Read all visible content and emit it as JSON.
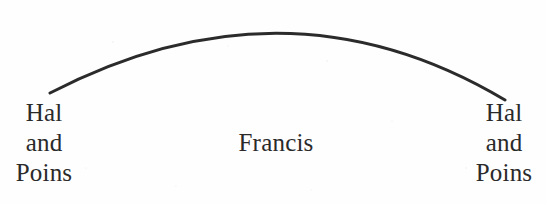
{
  "diagram": {
    "type": "arc-linked scene structure diagram",
    "background_color": "#fefefe",
    "ink_color": "#2a2a2a",
    "arc": {
      "name": "connecting-arc",
      "stroke_color": "#2b2b2b",
      "stroke_width": 3,
      "left_endpoint": [
        50,
        93
      ],
      "apex": [
        287,
        14
      ],
      "right_endpoint": [
        505,
        100
      ]
    },
    "labels": {
      "left": {
        "name": "hal-and-poins-left",
        "lines": [
          "Hal",
          "and",
          "Poins"
        ]
      },
      "center": {
        "name": "francis-center",
        "text": "Francis"
      },
      "right": {
        "name": "hal-and-poins-right",
        "lines": [
          "Hal",
          "and",
          "Poins"
        ]
      }
    }
  }
}
